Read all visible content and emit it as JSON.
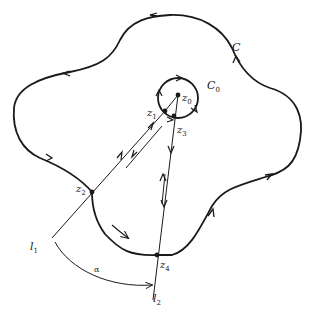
{
  "figure": {
    "type": "complex-analysis-contour-diagram",
    "colors": {
      "ink": "#1a1a1a",
      "background": "#ffffff"
    }
  },
  "labels": {
    "C": "C",
    "C0": {
      "base": "C",
      "sub": "0"
    },
    "z0": {
      "base": "z",
      "sub": "0"
    },
    "z1": {
      "base": "z",
      "sub": "1"
    },
    "z2": {
      "base": "z",
      "sub": "2"
    },
    "z3": {
      "base": "z",
      "sub": "3"
    },
    "z4": {
      "base": "z",
      "sub": "4"
    },
    "l1": {
      "base": "l",
      "sub": "1"
    },
    "l2": {
      "base": "l",
      "sub": "2"
    },
    "alpha": "α"
  },
  "points": [
    {
      "name": "z0",
      "x": 178,
      "y": 95
    },
    {
      "name": "z1",
      "x": 165,
      "y": 111
    },
    {
      "name": "z2",
      "x": 92,
      "y": 192
    },
    {
      "name": "z3",
      "x": 174,
      "y": 116
    },
    {
      "name": "z4",
      "x": 157,
      "y": 255
    }
  ]
}
